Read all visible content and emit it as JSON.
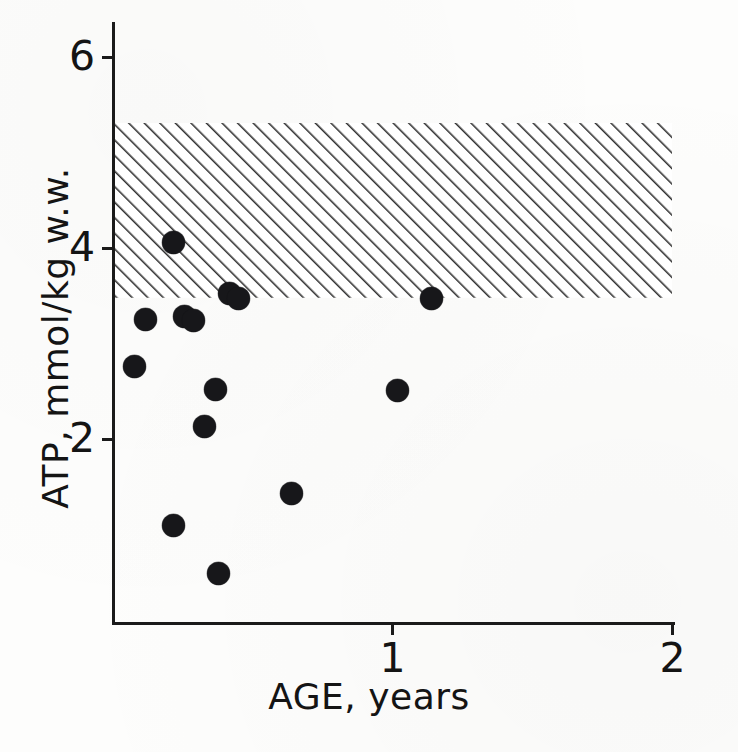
{
  "figure": {
    "background_color": "#fdfdfc",
    "ink_color": "#17171a"
  },
  "chart_data": {
    "type": "scatter",
    "title": "",
    "xlabel": "AGE, years",
    "ylabel": "ATP, mmol/kg w.w.",
    "xlim": [
      0,
      2.01
    ],
    "ylim": [
      0,
      6.3
    ],
    "grid": false,
    "legend": null,
    "x_ticks": [
      {
        "value": 1,
        "label": "1"
      },
      {
        "value": 2,
        "label": "2"
      }
    ],
    "y_ticks": [
      {
        "value": 2,
        "label": "2"
      },
      {
        "value": 4,
        "label": "4"
      },
      {
        "value": 6,
        "label": "6"
      }
    ],
    "series": [
      {
        "name": "ATP concentration",
        "marker": "filled-circle",
        "marker_color": "#17171a",
        "points": [
          {
            "x": 0.22,
            "y": 4.06
          },
          {
            "x": 0.12,
            "y": 3.25
          },
          {
            "x": 0.26,
            "y": 3.28
          },
          {
            "x": 0.29,
            "y": 3.24
          },
          {
            "x": 0.42,
            "y": 3.52
          },
          {
            "x": 0.45,
            "y": 3.47
          },
          {
            "x": 1.14,
            "y": 3.47
          },
          {
            "x": 0.08,
            "y": 2.76
          },
          {
            "x": 0.37,
            "y": 2.52
          },
          {
            "x": 1.02,
            "y": 2.51
          },
          {
            "x": 0.33,
            "y": 2.13
          },
          {
            "x": 0.64,
            "y": 1.43
          },
          {
            "x": 0.22,
            "y": 1.09
          },
          {
            "x": 0.38,
            "y": 0.59
          }
        ]
      }
    ],
    "annotations": [
      {
        "type": "hatched-band",
        "name": "normal-reference-range",
        "y_min": 3.48,
        "y_max": 5.31,
        "x_min": 0,
        "x_max": 2.0,
        "hatch": "forward-slash",
        "hatch_color": "#2b2b2b"
      }
    ]
  },
  "axes": {
    "x_title": "AGE, years",
    "y_title": "ATP, mmol/kg w.w."
  }
}
